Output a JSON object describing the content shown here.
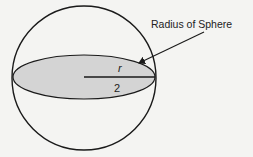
{
  "diagram": {
    "annotation_label": "Radius of Sphere",
    "radius_symbol": "r",
    "radius_denominator": "2",
    "colors": {
      "background": "#f4f4f2",
      "stroke": "#1a1a1a",
      "ellipse_fill": "#d4d4d4"
    }
  }
}
